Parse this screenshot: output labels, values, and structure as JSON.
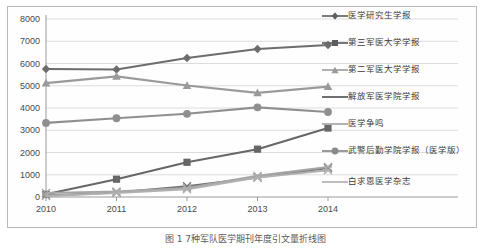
{
  "caption": "图 1  7种军队医学期刊年度引文量折线图",
  "chart_data": {
    "type": "line",
    "title": "",
    "subtitle": "",
    "xlabel": "",
    "ylabel": "",
    "x": [
      "2010",
      "2011",
      "2012",
      "2013",
      "2014"
    ],
    "categories": [
      "2010",
      "2011",
      "2012",
      "2013",
      "2014"
    ],
    "ylim": [
      0,
      8000
    ],
    "yticks": [
      0,
      1000,
      2000,
      3000,
      4000,
      5000,
      6000,
      7000,
      8000
    ],
    "ytick_labels": [
      "0",
      "1000",
      "2000",
      "3000",
      "4000",
      "5000",
      "6000",
      "7000",
      "8000"
    ],
    "grid": true,
    "grid_axis": "y",
    "legend_position": "right",
    "series": [
      {
        "name": "医学研究生学报",
        "marker": "diamond",
        "color": "#6d6d6d",
        "values": [
          5750,
          5730,
          6250,
          6650,
          6830
        ]
      },
      {
        "name": "第三军医大学学报",
        "marker": "square",
        "color": "#676767",
        "values": [
          120,
          800,
          1560,
          2150,
          3100
        ]
      },
      {
        "name": "第二军医大学学报",
        "marker": "triangle",
        "color": "#9a9a9a",
        "values": [
          5120,
          5420,
          5010,
          4680,
          4960
        ]
      },
      {
        "name": "解放军医学院学报",
        "marker": "none",
        "color": "#6f6f6f",
        "values": [
          60,
          200,
          480,
          880,
          1300
        ]
      },
      {
        "name": "医学争鸣",
        "marker": "none",
        "color": "#a5a5a5",
        "values": [
          180,
          250,
          400,
          950,
          1350
        ]
      },
      {
        "name": "武警后勤学院学报（医学版）",
        "marker": "circle",
        "color": "#8f8f8f",
        "values": [
          3330,
          3540,
          3740,
          4030,
          3820
        ]
      },
      {
        "name": "白求恩医学杂志",
        "marker": "none",
        "color": "#b0b0b0",
        "values": [
          50,
          180,
          350,
          880,
          1200
        ]
      }
    ]
  },
  "legend": {
    "items": [
      {
        "label": "医学研究生学报"
      },
      {
        "label": "第三军医大学学报"
      },
      {
        "label": "第二军医大学学报"
      },
      {
        "label": "解放军医学院学报"
      },
      {
        "label": "医学争鸣"
      },
      {
        "label": "武警后勤学院学报（医学版）"
      },
      {
        "label": "白求恩医学杂志"
      }
    ]
  }
}
